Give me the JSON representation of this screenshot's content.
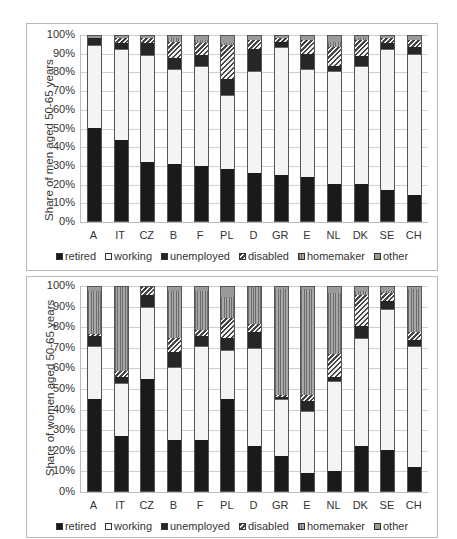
{
  "chart_data": [
    {
      "type": "bar",
      "stacked": true,
      "title": "",
      "xlabel": "",
      "ylabel": "Share of men aged 50-65 years",
      "ylim": [
        0,
        100
      ],
      "yticks": [
        "0%",
        "10%",
        "20%",
        "30%",
        "40%",
        "50%",
        "60%",
        "70%",
        "80%",
        "90%",
        "100%"
      ],
      "grid": true,
      "legend_position": "bottom",
      "categories": [
        "A",
        "IT",
        "CZ",
        "B",
        "F",
        "PL",
        "D",
        "GR",
        "E",
        "NL",
        "DK",
        "SE",
        "CH"
      ],
      "series": [
        {
          "name": "retired",
          "values": [
            50,
            44,
            32,
            31,
            30,
            28,
            26,
            25,
            24,
            20,
            20,
            17,
            14
          ]
        },
        {
          "name": "working",
          "values": [
            45,
            49,
            58,
            51,
            54,
            40,
            55,
            69,
            58,
            61,
            64,
            76,
            76
          ]
        },
        {
          "name": "unemployed",
          "values": [
            4,
            3,
            6,
            6,
            6,
            9,
            12,
            3,
            8,
            3,
            5,
            3,
            4
          ]
        },
        {
          "name": "disabled",
          "values": [
            0,
            3,
            3,
            9,
            6,
            18,
            5,
            2,
            8,
            10,
            9,
            3,
            4
          ]
        },
        {
          "name": "homemaker",
          "values": [
            0,
            0,
            0,
            2,
            2,
            1,
            0,
            0,
            0,
            3,
            1,
            0,
            0
          ]
        },
        {
          "name": "other",
          "values": [
            1,
            1,
            1,
            1,
            2,
            4,
            2,
            1,
            2,
            3,
            1,
            1,
            2
          ]
        }
      ]
    },
    {
      "type": "bar",
      "stacked": true,
      "title": "",
      "xlabel": "",
      "ylabel": "Share of women aged 50-65 years",
      "ylim": [
        0,
        100
      ],
      "yticks": [
        "0%",
        "10%",
        "20%",
        "30%",
        "40%",
        "50%",
        "60%",
        "70%",
        "80%",
        "90%",
        "100%"
      ],
      "grid": true,
      "legend_position": "bottom",
      "categories": [
        "A",
        "IT",
        "CZ",
        "B",
        "F",
        "PL",
        "D",
        "GR",
        "E",
        "NL",
        "DK",
        "SE",
        "CH"
      ],
      "series": [
        {
          "name": "retired",
          "values": [
            45,
            27,
            55,
            25,
            25,
            45,
            22,
            17,
            9,
            10,
            22,
            20,
            12
          ]
        },
        {
          "name": "working",
          "values": [
            26,
            26,
            35,
            36,
            46,
            24,
            48,
            28,
            30,
            44,
            53,
            69,
            59
          ]
        },
        {
          "name": "unemployed",
          "values": [
            5,
            3,
            6,
            7,
            5,
            6,
            8,
            1,
            5,
            2,
            6,
            4,
            3
          ]
        },
        {
          "name": "disabled",
          "values": [
            1,
            3,
            4,
            7,
            3,
            10,
            4,
            1,
            3,
            11,
            15,
            4,
            4
          ]
        },
        {
          "name": "homemaker",
          "values": [
            21,
            41,
            0,
            23,
            19,
            10,
            18,
            52,
            52,
            30,
            2,
            1,
            21
          ]
        },
        {
          "name": "other",
          "values": [
            2,
            0,
            0,
            2,
            2,
            5,
            0,
            1,
            1,
            3,
            2,
            2,
            1
          ]
        }
      ]
    }
  ],
  "legend": {
    "items": [
      {
        "key": "retired",
        "label": "retired"
      },
      {
        "key": "working",
        "label": "working"
      },
      {
        "key": "unemployed",
        "label": "unemployed"
      },
      {
        "key": "disabled",
        "label": "disabled"
      },
      {
        "key": "homemaker",
        "label": "homemaker"
      },
      {
        "key": "other",
        "label": "other"
      }
    ]
  },
  "charts": {
    "men": {
      "ylabel": "Share of men aged 50-65 years"
    },
    "women": {
      "ylabel": "Share of women aged 50-65 years"
    }
  }
}
